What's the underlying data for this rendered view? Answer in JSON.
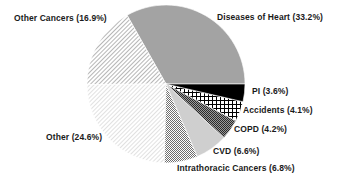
{
  "chart_data": {
    "type": "pie",
    "title": "",
    "start_angle_deg": 0,
    "direction": "counterclockwise",
    "slices": [
      {
        "label": "Diseases of  Heart",
        "value": 33.2,
        "display": "Diseases of  Heart  (33.2%)",
        "fill": "#a3a3a3",
        "pattern": "solid-gray"
      },
      {
        "label": "Other Cancers",
        "value": 16.9,
        "display": "Other Cancers (16.9%)",
        "fill": "#ffffff",
        "pattern": "diagonal-hatch-dense"
      },
      {
        "label": "Other",
        "value": 24.6,
        "display": "Other  (24.6%)",
        "fill": "#ffffff",
        "pattern": "diagonal-hatch-light"
      },
      {
        "label": "Intrathoracic Cancers",
        "value": 6.8,
        "display": "Intrathoracic Cancers (6.8%)",
        "fill": "#ffffff",
        "pattern": "checker-fine"
      },
      {
        "label": "CVD",
        "value": 6.6,
        "display": "CVD (6.6%)",
        "fill": "#cfcfcf",
        "pattern": "solid-light-gray"
      },
      {
        "label": "COPD",
        "value": 4.2,
        "display": "COPD (4.2%)",
        "fill": "#ffffff",
        "pattern": "checker-dense"
      },
      {
        "label": "Accidents",
        "value": 4.1,
        "display": "Accidents  (4.1%)",
        "fill": "#ffffff",
        "pattern": "grid"
      },
      {
        "label": "PI",
        "value": 3.6,
        "display": "PI  (3.6%)",
        "fill": "#000000",
        "pattern": "solid-black"
      }
    ],
    "legend": "none (direct labels)",
    "grid": false
  },
  "labels": {
    "heart": "Diseases of  Heart  (33.2%)",
    "other_cancers": "Other Cancers (16.9%)",
    "other": "Other  (24.6%)",
    "intrathoracic": "Intrathoracic Cancers (6.8%)",
    "cvd": "CVD (6.6%)",
    "copd": "COPD (4.2%)",
    "accidents": "Accidents  (4.1%)",
    "pi": "PI  (3.6%)"
  }
}
